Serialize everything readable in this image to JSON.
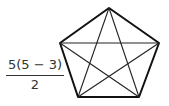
{
  "formula": {
    "numerator": "5(5 − 3)",
    "denominator": "2"
  },
  "pentagon": {
    "vertices": [
      {
        "x": 109,
        "y": 8
      },
      {
        "x": 159,
        "y": 43
      },
      {
        "x": 139,
        "y": 97
      },
      {
        "x": 78,
        "y": 97
      },
      {
        "x": 60,
        "y": 43
      }
    ],
    "stroke": "#111111"
  }
}
